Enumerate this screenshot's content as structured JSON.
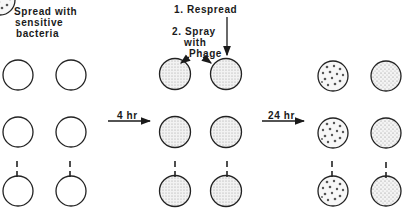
{
  "labels": {
    "spread": [
      "Spread with",
      "sensitive",
      "bacteria"
    ],
    "step1": "1. Respread",
    "step2": [
      "2. Spray",
      "with",
      "Phage"
    ],
    "time1": "4 hr",
    "time2": "24 hr"
  },
  "columns": [
    {
      "stage": "initial",
      "fill": "empty",
      "x": [
        18,
        71
      ]
    },
    {
      "stage": "after-4hr",
      "fill": "stippled-lawn",
      "x": [
        175,
        226
      ]
    },
    {
      "stage": "after-24hr",
      "fill": [
        "plaques",
        "lawn"
      ],
      "x": [
        333,
        386
      ]
    }
  ],
  "rows_y": [
    75,
    132,
    191
  ],
  "colors": {
    "ink": "#1a1a1a",
    "stipple": "#bdbdbd",
    "lawn_bg": "#ececec"
  }
}
